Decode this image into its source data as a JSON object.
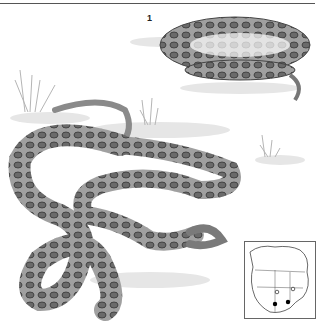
{
  "figure": {
    "number_label": "1",
    "colors": {
      "rule": "#555555",
      "snake_body": "#9a9a9a",
      "snake_blotch": "#555555",
      "ground_shadow": "#e0e0e0",
      "grass": "#b8b8b8"
    }
  },
  "range_map": {
    "description": "North America range map",
    "markers": [
      {
        "type": "open-circle"
      },
      {
        "type": "open-circle"
      },
      {
        "type": "filled-dot"
      },
      {
        "type": "filled-dot"
      }
    ]
  }
}
